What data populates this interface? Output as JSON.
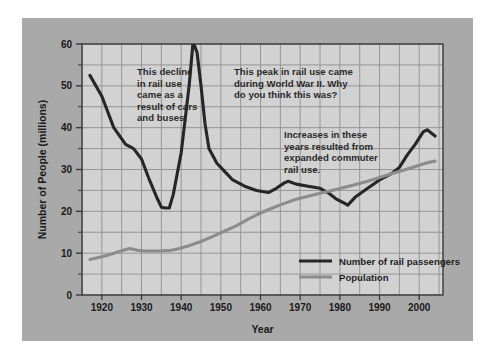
{
  "chart_data": {
    "type": "line",
    "title": "",
    "xlabel": "Year",
    "ylabel": "Number of People (millions)",
    "xlim": [
      1915,
      2006
    ],
    "ylim": [
      0,
      60
    ],
    "xticks": [
      1920,
      1930,
      1940,
      1950,
      1960,
      1970,
      1980,
      1990,
      2000
    ],
    "xtick_labels": [
      "1920",
      "1930",
      "1940",
      "1950",
      "1960",
      "1970",
      "1980",
      "1990",
      "2000"
    ],
    "x_minor_step": 5,
    "yticks": [
      0,
      10,
      20,
      30,
      40,
      50,
      60
    ],
    "ytick_labels": [
      "0",
      "10",
      "20",
      "30",
      "40",
      "50",
      "60"
    ],
    "y_minor_step": 5,
    "grid": true,
    "legend_position": "lower-right",
    "series": [
      {
        "name": "Number of rail passengers",
        "color": "#262626",
        "width": 3.1,
        "x": [
          1917,
          1920,
          1923,
          1926,
          1928,
          1930,
          1932,
          1934,
          1935,
          1936,
          1937,
          1938,
          1940,
          1942,
          1943,
          1944,
          1945,
          1946,
          1947,
          1949,
          1951,
          1953,
          1956,
          1959,
          1962,
          1964,
          1966,
          1967,
          1969,
          1972,
          1975,
          1977,
          1979,
          1981,
          1982,
          1984,
          1987,
          1990,
          1993,
          1995,
          1997,
          1999,
          2001,
          2002,
          2004
        ],
        "y": [
          52.5,
          47.5,
          40.0,
          36.0,
          35.0,
          32.5,
          27.5,
          23.0,
          21.0,
          20.8,
          20.8,
          24.0,
          34.0,
          50.0,
          60.5,
          58.0,
          50.0,
          41.0,
          35.0,
          31.5,
          29.5,
          27.5,
          26.0,
          25.0,
          24.5,
          25.5,
          26.8,
          27.2,
          26.5,
          26.0,
          25.5,
          24.5,
          23.0,
          22.0,
          21.5,
          23.5,
          25.5,
          27.5,
          29.0,
          30.5,
          33.5,
          36.0,
          39.0,
          39.5,
          38.0
        ]
      },
      {
        "name": "Population",
        "color": "#8c8c8c",
        "width": 3.1,
        "x": [
          1917,
          1921,
          1925,
          1927,
          1929,
          1931,
          1934,
          1937,
          1939,
          1942,
          1945,
          1948,
          1951,
          1954,
          1957,
          1960,
          1963,
          1966,
          1969,
          1972,
          1975,
          1978,
          1981,
          1984,
          1987,
          1990,
          1993,
          1996,
          1999,
          2002,
          2004
        ],
        "y": [
          8.5,
          9.4,
          10.6,
          11.1,
          10.7,
          10.5,
          10.5,
          10.6,
          11.0,
          11.8,
          12.8,
          14.0,
          15.3,
          16.6,
          18.2,
          19.6,
          20.8,
          21.9,
          22.9,
          23.6,
          24.3,
          25.0,
          25.7,
          26.4,
          27.2,
          28.1,
          29.0,
          29.8,
          30.7,
          31.6,
          32.0
        ]
      }
    ],
    "annotations": [
      {
        "name": "annotation-rail-decline",
        "lines": [
          "This decline",
          "in rail use",
          "came as a",
          "result of cars",
          "and buses."
        ],
        "x": 115,
        "y": 57
      },
      {
        "name": "annotation-wwii-peak",
        "lines": [
          "This peak in rail use came",
          "during World War II. Why",
          "do you think this was?"
        ],
        "x": 212,
        "y": 57
      },
      {
        "name": "annotation-commuter-rail",
        "lines": [
          "Increases in these",
          "years resulted from",
          "expanded commuter",
          "rail use."
        ],
        "x": 262,
        "y": 120
      }
    ]
  },
  "colors": {
    "page_background": "#ffffff",
    "card_background": "#a9a9a9",
    "plot_background": "#d2d2d2",
    "grid": "#8f8f8f",
    "axis": "#3a3a3a",
    "rail_series": "#262626",
    "population_series": "#8c8c8c",
    "text": "#1a1a1a"
  }
}
